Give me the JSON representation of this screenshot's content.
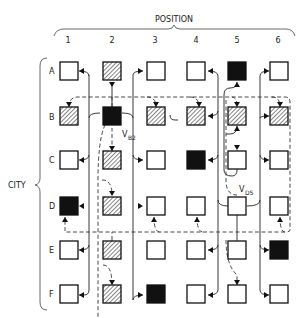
{
  "title": "POSITION",
  "axis": {
    "column_label": "POSITION",
    "row_label": "CITY",
    "columns": [
      "1",
      "2",
      "3",
      "4",
      "5",
      "6"
    ],
    "rows": [
      "A",
      "B",
      "C",
      "D",
      "E",
      "F"
    ]
  },
  "legend": {
    "empty": "white box",
    "hatched": "hatched box",
    "filled": "black box"
  },
  "grid": [
    [
      "empty",
      "hatched",
      "empty",
      "empty",
      "filled",
      "empty"
    ],
    [
      "hatched",
      "filled",
      "hatched",
      "hatched",
      "hatched",
      "hatched"
    ],
    [
      "empty",
      "hatched",
      "empty",
      "filled",
      "empty",
      "empty"
    ],
    [
      "filled",
      "hatched",
      "empty",
      "empty",
      "empty",
      "empty"
    ],
    [
      "empty",
      "hatched",
      "empty",
      "empty",
      "empty",
      "filled"
    ],
    [
      "empty",
      "hatched",
      "filled",
      "empty",
      "empty",
      "empty"
    ]
  ],
  "node_labels": {
    "vB2": {
      "main": "V",
      "sub": "B2"
    },
    "vD5": {
      "main": "V",
      "sub": "D5"
    }
  }
}
